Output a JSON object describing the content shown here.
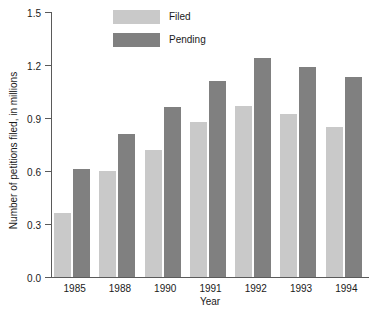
{
  "chart_data": {
    "type": "bar",
    "title": "",
    "xlabel": "Year",
    "ylabel": "Number of petitions filed, in millions",
    "categories": [
      "1985",
      "1988",
      "1990",
      "1991",
      "1992",
      "1993",
      "1994"
    ],
    "series": [
      {
        "name": "Filed",
        "color": "#c9c9c9",
        "values": [
          0.36,
          0.6,
          0.72,
          0.88,
          0.97,
          0.92,
          0.85
        ]
      },
      {
        "name": "Pending",
        "color": "#808080",
        "values": [
          0.61,
          0.81,
          0.96,
          1.11,
          1.24,
          1.19,
          1.13
        ]
      }
    ],
    "ylim": [
      0.0,
      1.5
    ],
    "yticks": [
      "0.0",
      "0.3",
      "0.6",
      "0.9",
      "1.2",
      "1.5"
    ],
    "ytick_values": [
      0.0,
      0.3,
      0.6,
      0.9,
      1.2,
      1.5
    ],
    "grid": false,
    "legend_position": "top-center",
    "legend": [
      {
        "label": "Filed",
        "color": "#c9c9c9"
      },
      {
        "label": "Pending",
        "color": "#808080"
      }
    ]
  },
  "axis_color": "#5a5a5a"
}
